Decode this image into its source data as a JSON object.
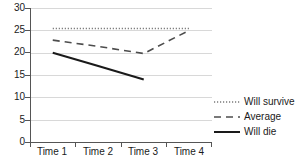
{
  "chart_data": {
    "type": "line",
    "title": "",
    "xlabel": "",
    "ylabel": "",
    "categories": [
      "Time 1",
      "Time 2",
      "Time 3",
      "Time 4"
    ],
    "ylim": [
      0,
      30
    ],
    "yticks": [
      0,
      5,
      10,
      15,
      20,
      25,
      30
    ],
    "ytick_labels": [
      "0",
      "5",
      "10",
      "15",
      "20",
      "25",
      "30"
    ],
    "grid": true,
    "legend_position": "right",
    "series": [
      {
        "name": "Will survive",
        "style": "dotted",
        "color": "#7a7a7a",
        "values": [
          25.4,
          25.4,
          25.4,
          25.4
        ]
      },
      {
        "name": "Average",
        "style": "dashed",
        "color": "#4d4d4d",
        "values": [
          22.8,
          21.4,
          19.8,
          25.0
        ]
      },
      {
        "name": "Will die",
        "style": "solid",
        "color": "#1a1a1a",
        "values": [
          20.0,
          17.0,
          14.0,
          null
        ]
      }
    ]
  },
  "legend": {
    "items": [
      {
        "label": "Will survive"
      },
      {
        "label": "Average"
      },
      {
        "label": "Will die"
      }
    ]
  },
  "axes": {
    "y_labels": [
      "30",
      "25",
      "20",
      "15",
      "10",
      "5",
      "0"
    ],
    "x_labels": [
      "Time 1",
      "Time 2",
      "Time 3",
      "Time 4"
    ]
  }
}
